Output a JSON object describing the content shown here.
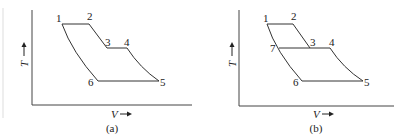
{
  "panels": [
    {
      "caption": "(a)",
      "x_axis_label": "V",
      "y_axis_label": "T",
      "points": {
        "1": "1",
        "2": "2",
        "3": "3",
        "4": "4",
        "5": "5",
        "6": "6"
      }
    },
    {
      "caption": "(b)",
      "x_axis_label": "V",
      "y_axis_label": "T",
      "points": {
        "1": "1",
        "2": "2",
        "3": "3",
        "4": "4",
        "5": "5",
        "6": "6",
        "7": "7"
      }
    }
  ]
}
